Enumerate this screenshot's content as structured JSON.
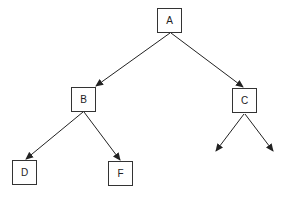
{
  "diagram": {
    "type": "tree",
    "nodes": [
      {
        "id": "A",
        "label": "A",
        "x": 157,
        "y": 8
      },
      {
        "id": "B",
        "label": "B",
        "x": 71,
        "y": 87
      },
      {
        "id": "C",
        "label": "C",
        "x": 232,
        "y": 88
      },
      {
        "id": "D",
        "label": "D",
        "x": 12,
        "y": 160
      },
      {
        "id": "F",
        "label": "F",
        "x": 108,
        "y": 161
      }
    ],
    "edges": [
      {
        "from": "A",
        "to": "B",
        "x1": 170,
        "y1": 33,
        "x2": 96,
        "y2": 86
      },
      {
        "from": "A",
        "to": "C",
        "x1": 171,
        "y1": 33,
        "x2": 243,
        "y2": 87
      },
      {
        "from": "B",
        "to": "D",
        "x1": 83,
        "y1": 112,
        "x2": 26,
        "y2": 159
      },
      {
        "from": "B",
        "to": "F",
        "x1": 84,
        "y1": 112,
        "x2": 120,
        "y2": 160
      },
      {
        "from": "C",
        "to": "open-left",
        "x1": 244,
        "y1": 114,
        "x2": 216,
        "y2": 151
      },
      {
        "from": "C",
        "to": "open-right",
        "x1": 245,
        "y1": 114,
        "x2": 273,
        "y2": 151
      }
    ]
  }
}
